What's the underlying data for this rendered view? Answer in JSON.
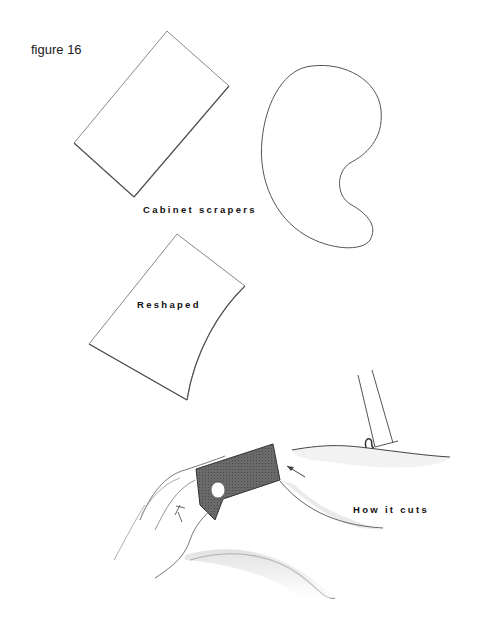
{
  "figure": {
    "label": "figure 16",
    "captions": {
      "cabinet_scrapers": "Cabinet scrapers",
      "reshaped": "Reshaped",
      "how_it_cuts": "How it cuts"
    },
    "illustrations": [
      {
        "name": "rectangular-scraper",
        "description": "Rectangular cabinet scraper, tilted"
      },
      {
        "name": "kidney-scraper",
        "description": "Kidney / gooseneck shaped cabinet scraper"
      },
      {
        "name": "reshaped-scraper",
        "description": "Rectangle scraper reshaped with concave edge"
      },
      {
        "name": "hands-scraping",
        "description": "Hands holding a bent scraper against a wooden surface"
      },
      {
        "name": "cutting-detail",
        "description": "Scraper edge lifting a curled shaving"
      }
    ]
  },
  "colors": {
    "line": "#6f6f6f",
    "ink": "#111111",
    "scraper_shade": "#5a5a5a"
  }
}
